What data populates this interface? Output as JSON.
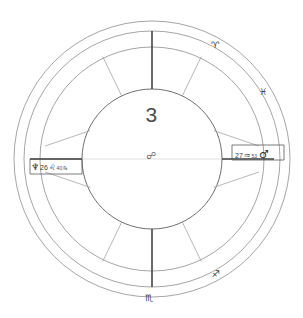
{
  "chart": {
    "center_house_number": "3",
    "center_aspect_glyph": "☍",
    "center_aspect_name": "opposition"
  },
  "sign_glyphs": [
    {
      "name": "aries",
      "glyph": "♈"
    },
    {
      "name": "pisces",
      "glyph": "♓"
    },
    {
      "name": "sagittarius",
      "glyph": "♐"
    },
    {
      "name": "scorpio",
      "glyph": "♏"
    }
  ],
  "planets": {
    "left": {
      "planet_glyph": "♆",
      "planet_name": "neptune",
      "degree": "26",
      "sign_glyph": "♌",
      "sign_name": "leo",
      "minute": "40",
      "retrograde": "℞"
    },
    "right": {
      "degree": "27",
      "sign_glyph": "♒",
      "sign_name": "aquarius",
      "minute": "53",
      "planet_glyph": "♂",
      "planet_name": "mars"
    }
  },
  "colors": {
    "background": "#ffffff",
    "ring_stroke": "#8e8e8e",
    "inner_stroke": "#6f6f6f",
    "spoke_stroke": "#9a9a9a",
    "axis_stroke": "#3a3a3a",
    "text": "#3c3c3c"
  },
  "geometry": {
    "center_x": 152,
    "center_y": 159,
    "outer_radius": 138,
    "band_outer_radius": 127,
    "inner_radius": 70
  }
}
